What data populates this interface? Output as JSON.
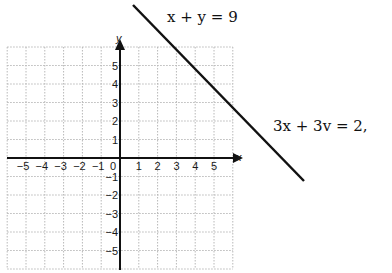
{
  "chart_data": {
    "type": "line",
    "title": "",
    "xlabel": "x",
    "ylabel": "y",
    "xlim": [
      -6,
      6
    ],
    "ylim": [
      -6,
      6
    ],
    "grid": true,
    "x_ticks": [
      "-5",
      "-4",
      "-3",
      "-2",
      "-1",
      "0",
      "1",
      "2",
      "3",
      "4",
      "5"
    ],
    "y_ticks": [
      "5",
      "4",
      "3",
      "2",
      "1",
      "-1",
      "-2",
      "-3",
      "-4",
      "-5"
    ],
    "series": [
      {
        "name": "x + y = 9",
        "type": "line",
        "points": [
          [
            3,
            6
          ],
          [
            6,
            3
          ]
        ],
        "note": "line extends beyond grid"
      }
    ],
    "annotations": [
      {
        "text": "x + y = 9",
        "position": "top, near start of line"
      },
      {
        "text": "3x + 3v = 2,",
        "position": "right of line"
      }
    ]
  },
  "labels": {
    "eq1": "x + y = 9",
    "eq2": "3x + 3v = 2,",
    "x_axis": "x",
    "y_axis": "y",
    "origin": "0"
  },
  "colors": {
    "axis": "#111111",
    "grid": "#b8b8b8",
    "line": "#111111"
  }
}
